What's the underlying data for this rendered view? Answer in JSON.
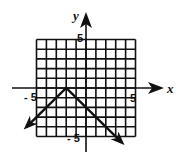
{
  "chart_data": {
    "type": "line",
    "title": "",
    "xlabel": "x",
    "ylabel": "y",
    "xlim": [
      -5,
      5
    ],
    "ylim": [
      -5,
      5
    ],
    "grid": true,
    "tick_labels": {
      "x_min": "-5",
      "x_max": "5",
      "y_min": "-5",
      "y_max": "5"
    },
    "series": [
      {
        "name": "absolute value graph y = -|x + 2|",
        "vertex": [
          -2,
          0
        ],
        "points": [
          [
            -6,
            -4
          ],
          [
            -2,
            0
          ],
          [
            3.6,
            -5.6
          ]
        ],
        "arrows_at_ends": true
      }
    ]
  },
  "axes": {
    "x_label": "x",
    "y_label": "y"
  },
  "ticks": {
    "x_neg": "- 5",
    "x_pos": "5",
    "y_pos": "5",
    "y_neg": "- 5"
  },
  "colors": {
    "ink": "#111111",
    "background": "#ffffff"
  }
}
